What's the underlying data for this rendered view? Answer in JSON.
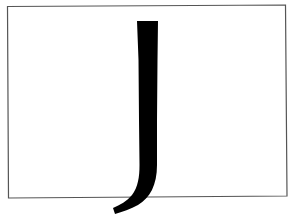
{
  "figure": {
    "letter": "J",
    "frame_color": "#555555",
    "glyph_color": "#000000",
    "background_color": "#ffffff"
  }
}
